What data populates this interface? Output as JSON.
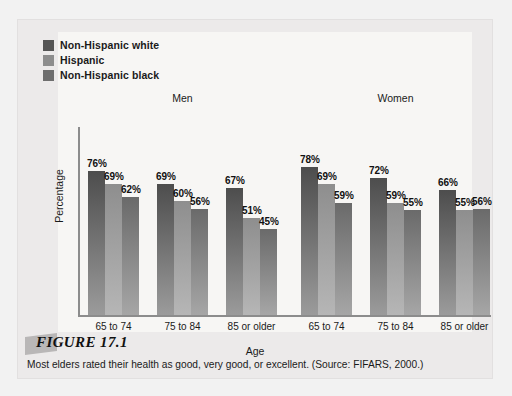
{
  "figure": {
    "number_label": "FIGURE 17.1",
    "caption": "Most elders rated their health as good, very good, or excellent.  (Source: FIFARS, 2000.)"
  },
  "chart_data": {
    "type": "bar",
    "title": "",
    "xlabel": "Age",
    "ylabel": "Percentage",
    "ylim": [
      0,
      100
    ],
    "grid": false,
    "legend_position": "top-left",
    "group_headers": [
      "Men",
      "Women"
    ],
    "categories": [
      "65 to 74",
      "75 to 84",
      "85 or older",
      "65 to 74",
      "75 to 84",
      "85 or older"
    ],
    "series": [
      {
        "name": "Non-Hispanic white",
        "color_top": "#4d4d4d",
        "color_bottom": "#9b9b9b",
        "swatch": "#555555",
        "values": [
          76,
          69,
          67,
          78,
          72,
          66
        ],
        "labels": [
          "76%",
          "69%",
          "67%",
          "78%",
          "72%",
          "66%"
        ]
      },
      {
        "name": "Hispanic",
        "color_top": "#8e8e8e",
        "color_bottom": "#b6b6b6",
        "swatch": "#8d8d8d",
        "values": [
          69,
          60,
          51,
          69,
          59,
          55
        ],
        "labels": [
          "69%",
          "60%",
          "51%",
          "69%",
          "59%",
          "55%"
        ]
      },
      {
        "name": "Non-Hispanic black",
        "color_top": "#6a6a6a",
        "color_bottom": "#a6a6a6",
        "swatch": "#6e6e6e",
        "values": [
          62,
          56,
          45,
          59,
          55,
          56
        ],
        "labels": [
          "62%",
          "56%",
          "45%",
          "59%",
          "55%",
          "56%"
        ]
      }
    ]
  }
}
